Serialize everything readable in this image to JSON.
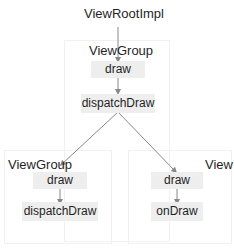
{
  "diagram": {
    "root": {
      "label": "ViewRootImpl"
    },
    "parent_group": {
      "label": "ViewGroup",
      "methods": [
        "draw",
        "dispatchDraw"
      ]
    },
    "child_group": {
      "label": "ViewGroup",
      "methods": [
        "draw",
        "dispatchDraw"
      ]
    },
    "child_view": {
      "label": "View",
      "methods": [
        "draw",
        "onDraw"
      ]
    },
    "colors": {
      "box": "#eeeeee",
      "arrow": "#888888",
      "text": "#1f1f1f"
    }
  }
}
